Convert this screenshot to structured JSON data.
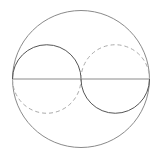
{
  "diagram": {
    "type": "geometry",
    "colors": {
      "outer_circle": "#8a8a8a",
      "diameter": "#8a8a8a",
      "solid_arc": "#555555",
      "dashed_arc": "#aaaaaa"
    },
    "outer_circle": {
      "cx": 81,
      "cy": 79,
      "r": 68.5
    },
    "diameter": {
      "x1": 12.5,
      "y1": 79,
      "x2": 149.5,
      "y2": 79
    },
    "left_circle": {
      "cx": 46.75,
      "cy": 79,
      "r": 34.25,
      "solid": "upper",
      "dashed": "lower"
    },
    "right_circle": {
      "cx": 115.25,
      "cy": 79,
      "r": 34.25,
      "solid": "lower",
      "dashed": "upper"
    }
  }
}
